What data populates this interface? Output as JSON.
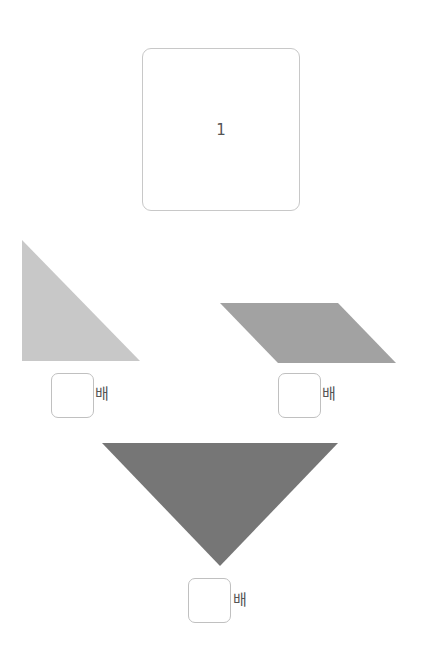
{
  "reference": {
    "label": "1"
  },
  "shapes": [
    {
      "name": "small-right-triangle",
      "fill": "#c8c8c8",
      "points": "22,240 22,361 140,361"
    },
    {
      "name": "parallelogram",
      "fill": "#a2a2a2",
      "points": "220,303 338,303 396,363 278,363"
    },
    {
      "name": "large-inverted-triangle",
      "fill": "#767676",
      "points": "102,443 338,443 220,566"
    }
  ],
  "answers": [
    {
      "value": "",
      "suffix": "배"
    },
    {
      "value": "",
      "suffix": "배"
    },
    {
      "value": "",
      "suffix": "배"
    }
  ]
}
